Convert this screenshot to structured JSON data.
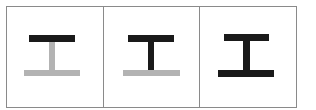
{
  "figure": {
    "colors": {
      "active": "#1a1a1a",
      "inactive": "#b3b3b3",
      "border": "#8a8a8a",
      "background": "#ffffff"
    },
    "panels": [
      {
        "index": 1,
        "top_bar": "active",
        "stem": "inactive",
        "bottom_bar": "inactive"
      },
      {
        "index": 2,
        "top_bar": "active",
        "stem": "active",
        "bottom_bar": "inactive"
      },
      {
        "index": 3,
        "top_bar": "active",
        "stem": "active",
        "bottom_bar": "active"
      }
    ]
  }
}
